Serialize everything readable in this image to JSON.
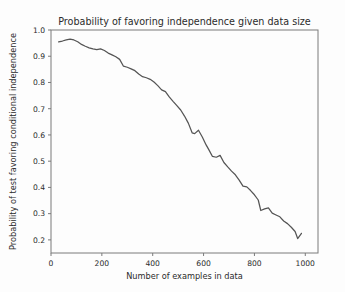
{
  "chart_data": {
    "type": "line",
    "title": "Probability of favoring independence given data size",
    "xlabel": "Number of examples in data",
    "ylabel": "Probability of test favoring conditional independence",
    "xlim": [
      0,
      1050
    ],
    "ylim": [
      0.15,
      1.0
    ],
    "xticks": [
      0,
      200,
      400,
      600,
      800,
      1000
    ],
    "xtick_labels": [
      "0",
      "200",
      "400",
      "600",
      "800",
      "1000"
    ],
    "yticks": [
      0.2,
      0.3,
      0.4,
      0.5,
      0.6,
      0.7,
      0.8,
      0.9,
      1.0
    ],
    "ytick_labels": [
      "0.2",
      "0.3",
      "0.4",
      "0.5",
      "0.6",
      "0.7",
      "0.8",
      "0.9",
      "1.0"
    ],
    "grid": false,
    "legend": false,
    "line_color": "#555555",
    "background": "#fdfdfd",
    "series": [
      {
        "name": "probability",
        "x": [
          30,
          45,
          60,
          75,
          90,
          105,
          120,
          135,
          150,
          165,
          180,
          195,
          210,
          225,
          240,
          255,
          270,
          285,
          300,
          315,
          330,
          345,
          360,
          375,
          390,
          405,
          420,
          435,
          450,
          465,
          480,
          495,
          510,
          525,
          540,
          555,
          565,
          580,
          595,
          610,
          620,
          635,
          650,
          665,
          680,
          695,
          710,
          725,
          740,
          755,
          770,
          785,
          800,
          815,
          825,
          840,
          855,
          870,
          885,
          900,
          915,
          930,
          945,
          960,
          970,
          985
        ],
        "y": [
          0.955,
          0.958,
          0.962,
          0.965,
          0.962,
          0.955,
          0.945,
          0.938,
          0.932,
          0.928,
          0.925,
          0.928,
          0.922,
          0.912,
          0.905,
          0.898,
          0.888,
          0.862,
          0.858,
          0.852,
          0.845,
          0.832,
          0.822,
          0.818,
          0.812,
          0.802,
          0.788,
          0.772,
          0.765,
          0.745,
          0.728,
          0.712,
          0.695,
          0.672,
          0.645,
          0.608,
          0.605,
          0.618,
          0.592,
          0.562,
          0.545,
          0.518,
          0.515,
          0.522,
          0.495,
          0.478,
          0.462,
          0.448,
          0.428,
          0.405,
          0.402,
          0.388,
          0.372,
          0.352,
          0.312,
          0.318,
          0.322,
          0.302,
          0.295,
          0.288,
          0.272,
          0.262,
          0.248,
          0.232,
          0.205,
          0.225
        ]
      }
    ]
  }
}
